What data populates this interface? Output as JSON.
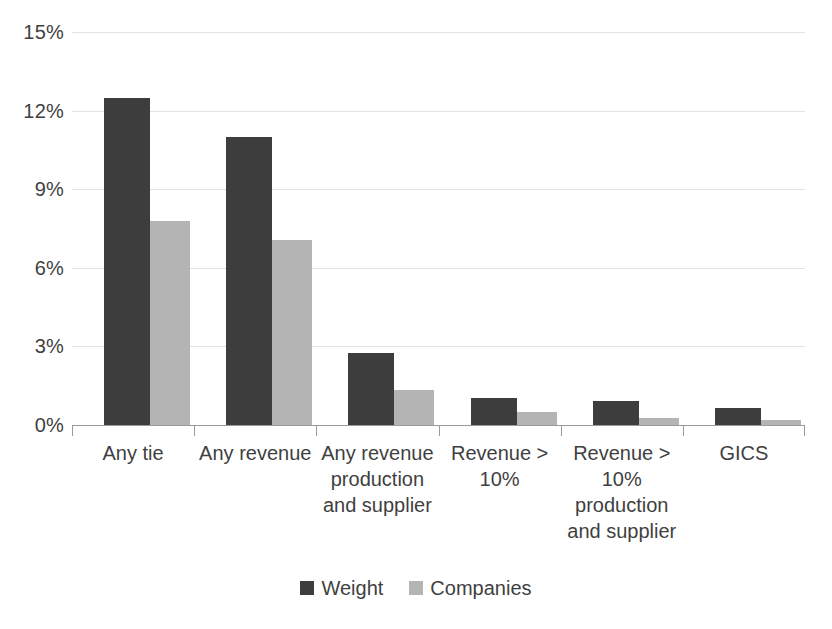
{
  "chart_data": {
    "type": "bar",
    "title": "",
    "xlabel": "",
    "ylabel": "",
    "ylim": [
      0,
      15
    ],
    "yticks": [
      0,
      3,
      6,
      9,
      12,
      15
    ],
    "ytick_labels": [
      "0%",
      "3%",
      "6%",
      "9%",
      "12%",
      "15%"
    ],
    "grid": true,
    "legend_position": "bottom",
    "categories": [
      "Any tie",
      "Any revenue",
      "Any revenue production and supplier",
      "Revenue > 10%",
      "Revenue > 10% production and supplier",
      "GICS"
    ],
    "series": [
      {
        "name": "Weight",
        "color": "#3d3d3d",
        "values": [
          12.5,
          11.0,
          2.75,
          1.05,
          0.9,
          0.65
        ]
      },
      {
        "name": "Companies",
        "color": "#b4b4b4",
        "values": [
          7.8,
          7.05,
          1.35,
          0.5,
          0.25,
          0.2
        ]
      }
    ]
  },
  "axis": {
    "y_labels": [
      "15%",
      "12%",
      "9%",
      "6%",
      "3%",
      "0%"
    ]
  },
  "legend": {
    "items": [
      {
        "label": "Weight",
        "key": "weight"
      },
      {
        "label": "Companies",
        "key": "companies"
      }
    ]
  }
}
